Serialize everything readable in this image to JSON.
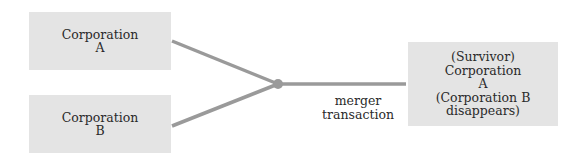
{
  "diagram": {
    "type": "merger-flow",
    "colors": {
      "box_fill": "#e4e4e4",
      "connector": "#9a9a9a",
      "text": "#2a2a2a",
      "background": "#ffffff"
    },
    "nodes": {
      "corporation_a": {
        "lines": [
          "Corporation",
          "A"
        ]
      },
      "corporation_b": {
        "lines": [
          "Corporation",
          "B"
        ]
      },
      "survivor": {
        "lines": [
          "(Survivor)",
          "Corporation",
          "A",
          "(Corporation B",
          "disappears)"
        ]
      }
    },
    "edge_label": {
      "lines": [
        "merger",
        "transaction"
      ]
    }
  }
}
